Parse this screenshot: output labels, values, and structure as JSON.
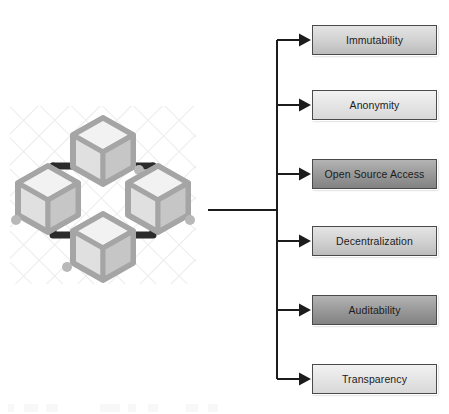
{
  "diagram": {
    "illustration": {
      "name": "blockchain-network-cubes",
      "cube_count": 4,
      "description": "Four isometric wireframe cubes arranged in a diamond, linked by a dark square connector path over a faint crosshatch pattern",
      "colors": {
        "cube_outline": "#9a9a9a",
        "cube_face_light": "#e3e3e3",
        "cube_face_mid": "#c9c9c9",
        "cube_face_dark": "#b0b0b0",
        "link_path": "#2b2b2b",
        "hatch": "#ededed"
      }
    },
    "connector": {
      "color": "#1c1c1c",
      "stem_label": "main-stem",
      "branch_count": 6
    },
    "nodes": [
      {
        "id": "immutability",
        "label": "Immutability",
        "shade": "shade-medium",
        "top": 25,
        "fill": "#d2d2d2"
      },
      {
        "id": "anonymity",
        "label": "Anonymity",
        "shade": "shade-light",
        "top": 90,
        "fill": "#e6e6e6"
      },
      {
        "id": "open-source-access",
        "label": "Open Source Access",
        "shade": "shade-dark",
        "top": 159,
        "fill": "#9c9c9c"
      },
      {
        "id": "decentralization",
        "label": "Decentralization",
        "shade": "shade-medium",
        "top": 226,
        "fill": "#d2d2d2"
      },
      {
        "id": "auditability",
        "label": "Auditability",
        "shade": "shade-dark",
        "top": 295,
        "fill": "#9c9c9c"
      },
      {
        "id": "transparency",
        "label": "Transparency",
        "shade": "shade-light",
        "top": 364,
        "fill": "#e6e6e6"
      }
    ]
  }
}
